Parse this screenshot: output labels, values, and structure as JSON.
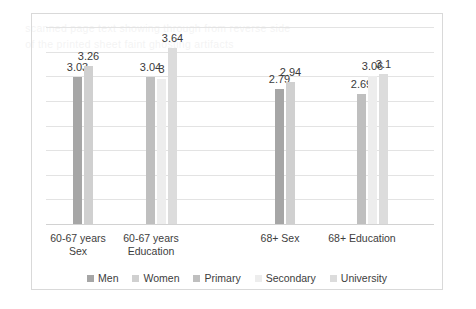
{
  "chart_data": {
    "type": "bar",
    "title": "",
    "subtitle": "",
    "xlabel": "",
    "ylabel": "",
    "ylim": [
      0,
      4.34
    ],
    "grid": true,
    "grid_count": 9,
    "legend_position": "bottom",
    "axis_tick_labels": [],
    "categories": [
      "60-67 years\nSex",
      "60-67 years\nEducation",
      "68+ Sex",
      "68+ Education"
    ],
    "category_lines": [
      [
        "60-67 years",
        "Sex"
      ],
      [
        "60-67 years",
        "Education"
      ],
      [
        "68+ Sex",
        ""
      ],
      [
        "68+ Education",
        ""
      ]
    ],
    "series": [
      {
        "name": "Men",
        "color": "#a6a6a6",
        "values": [
          3.03,
          null,
          2.79,
          null
        ]
      },
      {
        "name": "Women",
        "color": "#d0d0d0",
        "values": [
          3.26,
          null,
          2.94,
          null
        ]
      },
      {
        "name": "Primary",
        "color": "#bfbfbf",
        "values": [
          null,
          3.04,
          null,
          2.69
        ]
      },
      {
        "name": "Secondary",
        "color": "#ededed",
        "values": [
          null,
          3.0,
          null,
          3.06
        ]
      },
      {
        "name": "University",
        "color": "#dcdcdc",
        "values": [
          null,
          3.64,
          null,
          3.1
        ]
      }
    ],
    "groups": [
      {
        "category": "60-67 years Sex",
        "bars": [
          {
            "series": "Men",
            "value": 3.03,
            "label": "3.03"
          },
          {
            "series": "Women",
            "value": 3.26,
            "label": "3.26"
          }
        ]
      },
      {
        "category": "60-67 years Education",
        "bars": [
          {
            "series": "Primary",
            "value": 3.04,
            "label": "3.04"
          },
          {
            "series": "Secondary",
            "value": 3.0,
            "label": "3"
          },
          {
            "series": "University",
            "value": 3.64,
            "label": "3.64"
          }
        ]
      },
      {
        "category": "68+ Sex",
        "bars": [
          {
            "series": "Men",
            "value": 2.79,
            "label": "2.79"
          },
          {
            "series": "Women",
            "value": 2.94,
            "label": "2.94"
          }
        ]
      },
      {
        "category": "68+ Education",
        "bars": [
          {
            "series": "Primary",
            "value": 2.69,
            "label": "2.69"
          },
          {
            "series": "Secondary",
            "value": 3.06,
            "label": "3.06"
          },
          {
            "series": "University",
            "value": 3.1,
            "label": "3.1"
          }
        ]
      }
    ],
    "legend": [
      {
        "label": "Men",
        "color": "#a6a6a6"
      },
      {
        "label": "Women",
        "color": "#d0d0d0"
      },
      {
        "label": "Primary",
        "color": "#bfbfbf"
      },
      {
        "label": "Secondary",
        "color": "#ededed"
      },
      {
        "label": "University",
        "color": "#dcdcdc"
      }
    ]
  },
  "frame": {
    "border_color": "#d9d9d9",
    "gridline_color": "#e3e3e3",
    "background": "#ffffff"
  }
}
